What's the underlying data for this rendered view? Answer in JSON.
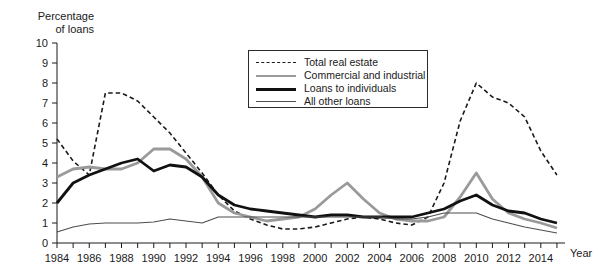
{
  "chart_data": {
    "type": "line",
    "title": "",
    "xlabel": "Year",
    "ylabel": "Percentage of loans",
    "ylim": [
      0,
      10
    ],
    "xlim": [
      1984,
      2015.5
    ],
    "ytick_values": [
      0,
      1,
      2,
      3,
      4,
      5,
      6,
      7,
      8,
      9,
      10
    ],
    "ytick_labels": [
      "0",
      "1",
      "2",
      "3",
      "4",
      "5",
      "6",
      "7",
      "8",
      "9",
      "10"
    ],
    "xtick_labels": [
      "1984",
      "1986",
      "1988",
      "1990",
      "1992",
      "1994",
      "1996",
      "1998",
      "2000",
      "2002",
      "2004",
      "2006",
      "2008",
      "2010",
      "2012",
      "2014"
    ],
    "xtick_values": [
      1984,
      1986,
      1988,
      1990,
      1992,
      1994,
      1996,
      1998,
      2000,
      2002,
      2004,
      2006,
      2008,
      2010,
      2012,
      2014
    ],
    "minor_tick_step": 1,
    "grid": false,
    "legend_position": "upper-center",
    "x": [
      1984,
      1985,
      1986,
      1987,
      1988,
      1989,
      1990,
      1991,
      1992,
      1993,
      1994,
      1995,
      1996,
      1997,
      1998,
      1999,
      2000,
      2001,
      2002,
      2003,
      2004,
      2005,
      2006,
      2007,
      2008,
      2009,
      2010,
      2011,
      2012,
      2013,
      2014,
      2015
    ],
    "series": [
      {
        "name": "Total real estate",
        "style": "dashed",
        "color": "#1a1a1a",
        "width": 1.6,
        "values": [
          5.2,
          4.1,
          3.4,
          7.5,
          7.5,
          7.1,
          6.3,
          5.5,
          4.5,
          3.5,
          2.4,
          1.6,
          1.2,
          0.9,
          0.7,
          0.7,
          0.8,
          1.0,
          1.2,
          1.3,
          1.2,
          1.0,
          0.9,
          1.3,
          3.0,
          6.1,
          8.0,
          7.3,
          7.0,
          6.3,
          4.6,
          3.4
        ]
      },
      {
        "name": "Commercial and industrial",
        "style": "solid",
        "color": "#9a9a9a",
        "width": 2.8,
        "values": [
          3.3,
          3.7,
          3.8,
          3.7,
          3.7,
          4.0,
          4.7,
          4.7,
          4.2,
          3.3,
          2.0,
          1.5,
          1.3,
          1.1,
          1.2,
          1.3,
          1.7,
          2.4,
          3.0,
          2.2,
          1.5,
          1.2,
          1.1,
          1.1,
          1.3,
          2.3,
          3.5,
          2.2,
          1.5,
          1.2,
          1.0,
          0.75
        ]
      },
      {
        "name": "Loans to individuals",
        "style": "solid",
        "color": "#111111",
        "width": 2.8,
        "values": [
          2.0,
          3.0,
          3.4,
          3.7,
          4.0,
          4.2,
          3.6,
          3.9,
          3.8,
          3.3,
          2.4,
          1.9,
          1.7,
          1.6,
          1.5,
          1.4,
          1.3,
          1.4,
          1.4,
          1.3,
          1.3,
          1.3,
          1.3,
          1.5,
          1.7,
          2.1,
          2.4,
          1.9,
          1.6,
          1.5,
          1.2,
          1.0
        ]
      },
      {
        "name": "All other loans",
        "style": "solid",
        "color": "#4d4d4d",
        "width": 1.1,
        "values": [
          0.55,
          0.8,
          0.95,
          1.0,
          1.0,
          1.0,
          1.05,
          1.2,
          1.1,
          1.0,
          1.3,
          1.3,
          1.3,
          1.3,
          1.3,
          1.3,
          1.3,
          1.3,
          1.3,
          1.3,
          1.3,
          1.2,
          1.2,
          1.3,
          1.5,
          1.5,
          1.5,
          1.2,
          1.0,
          0.8,
          0.65,
          0.5
        ]
      }
    ]
  },
  "legend": {
    "items": [
      {
        "label": "Total real estate",
        "swatch": "dashed-black"
      },
      {
        "label": "Commercial and industrial",
        "swatch": "solid-gray"
      },
      {
        "label": "Loans to individuals",
        "swatch": "solid-black-thick"
      },
      {
        "label": "All other loans",
        "swatch": "solid-thin"
      }
    ]
  },
  "axes": {
    "y_title": "Percentage\nof loans",
    "x_title": "Year"
  }
}
